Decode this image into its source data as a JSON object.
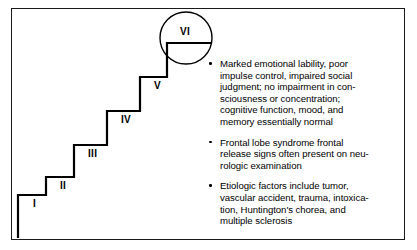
{
  "figure": {
    "type": "stepwise-progression-diagram",
    "background_color": "#ffffff",
    "line_color": "#000000",
    "frame_color": "#1a1a1a"
  },
  "staircase": {
    "description": "Ascending staircase of six stages labeled with Roman numerals, with the final stage circled",
    "steps": [
      {
        "label": "I",
        "index": 1,
        "label_x": 33,
        "label_y": 199
      },
      {
        "label": "II",
        "index": 2,
        "label_x": 60,
        "label_y": 181
      },
      {
        "label": "III",
        "index": 3,
        "label_x": 88,
        "label_y": 149
      },
      {
        "label": "IV",
        "index": 4,
        "label_x": 121,
        "label_y": 115
      },
      {
        "label": "V",
        "index": 5,
        "label_x": 154,
        "label_y": 81
      },
      {
        "label": "VI",
        "index": 6,
        "label_x": 180,
        "label_y": 27
      }
    ],
    "highlight": {
      "shape": "circle",
      "encircled_step": "VI",
      "center_x": 186,
      "center_y": 38,
      "radius": 26
    }
  },
  "text_block": {
    "bullets": [
      {
        "id": "bullet-clinical-features",
        "text": "Marked emotional lability, poor\nimpulse control, impaired social\njudgment; no impairment in con-\nsciousness or concentration;\ncognitive function, mood, and\nmemory essentially normal"
      },
      {
        "id": "bullet-frontal-lobe-signs",
        "text": "Frontal lobe syndrome frontal\nrelease signs often present on neu-\nrologic examination"
      },
      {
        "id": "bullet-etiologic-factors",
        "text": "Etiologic factors include tumor,\nvascular accident, trauma, intoxica-\ntion, Huntington's chorea, and\nmultiple sclerosis"
      }
    ]
  }
}
